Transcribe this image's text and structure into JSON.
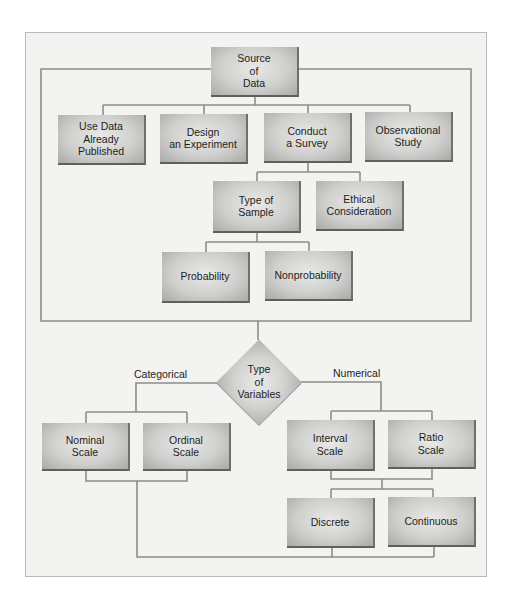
{
  "diagram": {
    "nodes": {
      "source": "Source\nof\nData",
      "use_data": "Use Data\nAlready\nPublished",
      "design": "Design\nan Experiment",
      "conduct": "Conduct\na Survey",
      "observational": "Observational\nStudy",
      "type_of_sample": "Type of\nSample",
      "ethical": "Ethical\nConsideration",
      "probability": "Probability",
      "nonprobability": "Nonprobability",
      "type_of_variables": "Type\nof\nVariables",
      "nominal": "Nominal\nScale",
      "ordinal": "Ordinal\nScale",
      "interval": "Interval\nScale",
      "ratio": "Ratio\nScale",
      "discrete": "Discrete",
      "continuous": "Continuous"
    },
    "edge_labels": {
      "categorical": "Categorical",
      "numerical": "Numerical"
    },
    "colors": {
      "line": "#8c8c8a",
      "frame_bg": "#f3f3f2",
      "box_mid": "#cfcfcd",
      "box_shadow": "#5f5f5d"
    }
  }
}
